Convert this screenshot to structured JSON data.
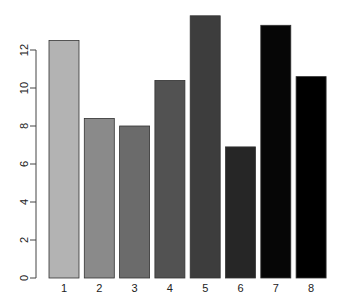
{
  "chart_data": {
    "type": "bar",
    "title": "",
    "xlabel": "",
    "ylabel": "",
    "categories": [
      "1",
      "2",
      "3",
      "4",
      "5",
      "6",
      "7",
      "8"
    ],
    "values": [
      12.5,
      8.4,
      8.0,
      10.4,
      13.8,
      6.9,
      13.3,
      10.6
    ],
    "colors": [
      "#b3b3b3",
      "#8a8a8a",
      "#6b6b6b",
      "#525252",
      "#3d3d3d",
      "#262626",
      "#060606",
      "#000000"
    ],
    "ylim": [
      0,
      14
    ],
    "yticks": [
      0,
      2,
      4,
      6,
      8,
      10,
      12
    ],
    "ytick_labels": [
      "0",
      "2",
      "4",
      "6",
      "8",
      "10",
      "12"
    ],
    "grid": false,
    "legend": null,
    "bar_border_color": "#333333"
  }
}
